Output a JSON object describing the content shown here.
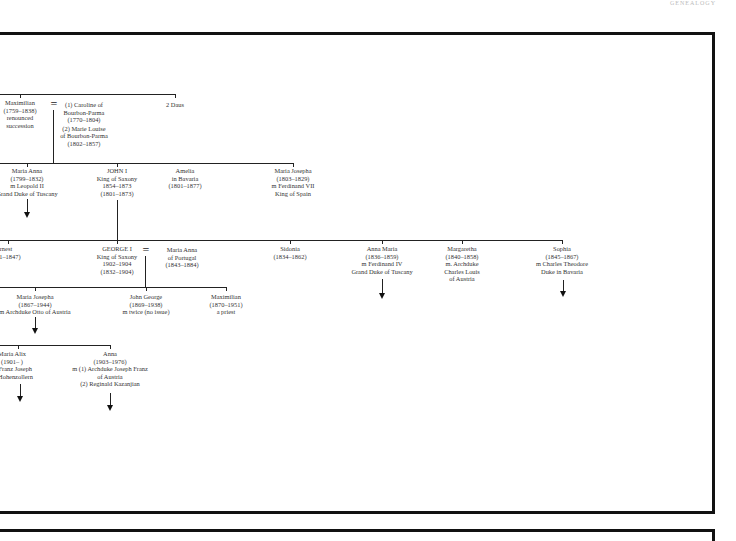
{
  "page": {
    "header_text": "GENEALOGY"
  },
  "tree": {
    "gen1": {
      "maximilian": [
        "Maximilian",
        "(1759–1838)",
        "renounced",
        "succession"
      ],
      "spouse_symbol": "=",
      "wives": [
        "(1) Caroline of",
        "Bourbon-Parma",
        "(1770–1804)",
        "(2) Marie Louise",
        "of Bourbon-Parma",
        "(1802–1857)"
      ],
      "daus": [
        "2 Daus"
      ]
    },
    "gen2": {
      "maria_anna": [
        "Maria Anna",
        "(1799–1832)",
        "m Leopold II",
        "Grand Duke of Tuscany"
      ],
      "john_i": [
        "JOHN I",
        "King of Saxony",
        "1854–1873",
        "(1801–1873)"
      ],
      "amelia": [
        "Amelia",
        "in Bavaria",
        "(1801–1877)"
      ],
      "maria_josepha": [
        "Maria Josepha",
        "(1803–1829)",
        "m Ferdinand VII",
        "King of Spain"
      ]
    },
    "gen3": {
      "ernest": [
        "Ernest",
        "(1831–1847)"
      ],
      "george_i": [
        "GEORGE I",
        "King of Saxony",
        "1902–1904",
        "(1832–1904)"
      ],
      "spouse_symbol": "=",
      "maria_anna_portugal": [
        "Maria Anna",
        "of Portugal",
        "(1843–1884)"
      ],
      "sidonia": [
        "Sidonia",
        "(1834–1862)"
      ],
      "anna_maria": [
        "Anna Maria",
        "(1836–1859)",
        "m Ferdinand IV",
        "Grand Duke of Tuscany"
      ],
      "margaretha": [
        "Margaretha",
        "(1840–1858)",
        "m. Archduke",
        "Charles Louis",
        "of Austria"
      ],
      "sophia": [
        "Sophia",
        "(1845–1867)",
        "m Charles Theodore",
        "Duke in Bavaria"
      ]
    },
    "gen4": {
      "maria_josepha": [
        "Maria Josepha",
        "(1867–1944)",
        "m Archduke Otto of Austria"
      ],
      "john_george": [
        "John George",
        "(1869–1938)",
        "m twice (no issue)"
      ],
      "maximilian": [
        "Maximilian",
        "(1870–1951)",
        "a priest"
      ]
    },
    "gen5": {
      "maria_alix": [
        "Maria Alix",
        "(1901–      )",
        "m Franz Joseph",
        "of Hohenzollern"
      ],
      "anna": [
        "Anna",
        "(1903–1976)",
        "m (1) Archduke Joseph Franz",
        "of Austria",
        "(2) Reginald Kazanjian"
      ]
    }
  }
}
